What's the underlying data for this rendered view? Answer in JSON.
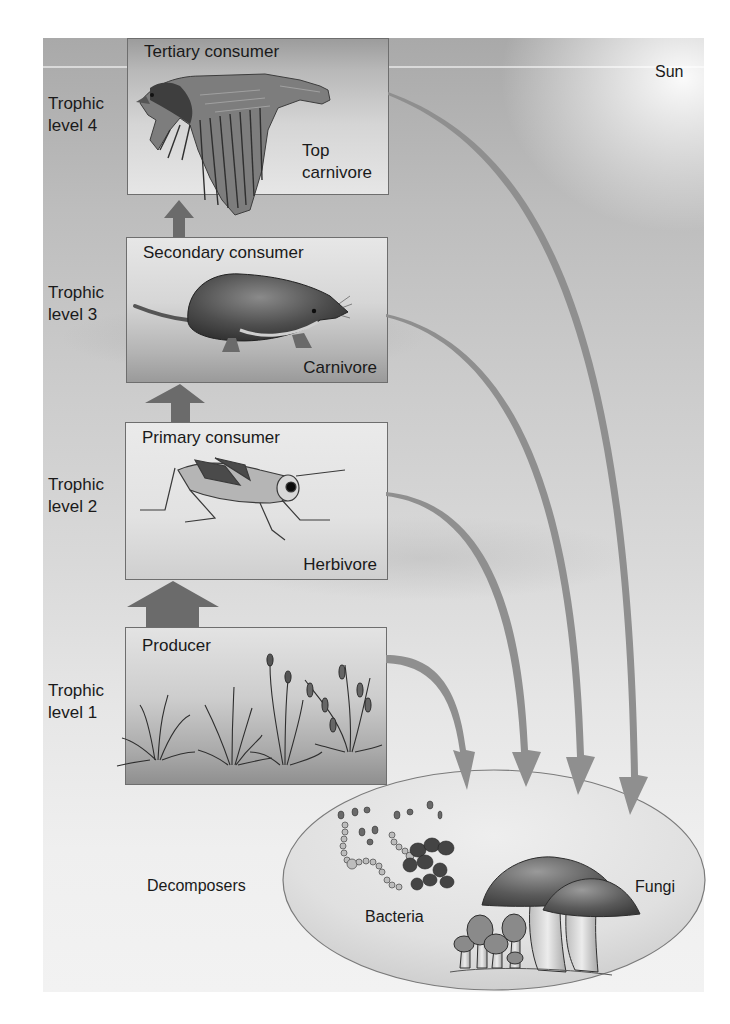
{
  "figure": {
    "sun_label": "Sun",
    "trophic_levels": [
      {
        "level_label": "Trophic\nlevel 4",
        "box_title": "Tertiary consumer",
        "role": "Top\ncarnivore",
        "organism": "hawk-illustration"
      },
      {
        "level_label": "Trophic\nlevel 3",
        "box_title": "Secondary consumer",
        "role": "Carnivore",
        "organism": "shrew-illustration"
      },
      {
        "level_label": "Trophic\nlevel 2",
        "box_title": "Primary consumer",
        "role": "Herbivore",
        "organism": "grasshopper-illustration"
      },
      {
        "level_label": "Trophic\nlevel 1",
        "box_title": "Producer",
        "role": "",
        "organism": "grass-plants-illustration"
      }
    ],
    "decomposers": {
      "label": "Decomposers",
      "bacteria_label": "Bacteria",
      "fungi_label": "Fungi"
    },
    "energy_flow": {
      "upward_arrows": [
        "level 1 → level 2",
        "level 2 → level 3",
        "level 3 → level 4"
      ],
      "decomposer_arrows": [
        "level 1 → decomposers",
        "level 2 → decomposers",
        "level 3 → decomposers",
        "level 4 → decomposers"
      ]
    },
    "colors": {
      "arrow_dark": "#6b6b6b",
      "arrow_light": "#9a9a9a",
      "box_border": "#6e6e6e",
      "ellipse_border": "#7a7a7a"
    }
  }
}
